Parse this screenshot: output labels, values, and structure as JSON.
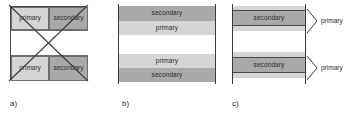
{
  "figure": {
    "title": "",
    "colors": {
      "primary_fill": "#d5d5d5",
      "secondary_fill": "#a9a9a9",
      "gap_fill": "#ffffff",
      "outline": "#4a4a4a",
      "text": "#2b2b2b",
      "background": "#ffffff"
    },
    "labels": {
      "primary": "primary",
      "secondary": "secondary"
    }
  },
  "panels": [
    {
      "id": "a",
      "caption": "a)",
      "crossed_out": true,
      "cells": [
        {
          "label": "primary",
          "kind": "primary",
          "position": "top-left"
        },
        {
          "label": "secondary",
          "kind": "secondary",
          "position": "top-right"
        },
        {
          "label": "",
          "kind": "gap",
          "position": "middle"
        },
        {
          "label": "primary",
          "kind": "primary",
          "position": "bottom-left"
        },
        {
          "label": "secondary",
          "kind": "secondary",
          "position": "bottom-right"
        }
      ]
    },
    {
      "id": "b",
      "caption": "b)",
      "crossed_out": false,
      "bands": [
        {
          "label": "secondary",
          "kind": "secondary"
        },
        {
          "label": "primary",
          "kind": "primary"
        },
        {
          "label": "",
          "kind": "gap"
        },
        {
          "label": "primary",
          "kind": "primary"
        },
        {
          "label": "secondary",
          "kind": "secondary"
        }
      ]
    },
    {
      "id": "c",
      "caption": "c)",
      "crossed_out": false,
      "bands": [
        {
          "label": "",
          "kind": "primary"
        },
        {
          "label": "secondary",
          "kind": "secondary"
        },
        {
          "label": "",
          "kind": "primary"
        },
        {
          "label": "",
          "kind": "gap"
        },
        {
          "label": "",
          "kind": "primary"
        },
        {
          "label": "secondary",
          "kind": "secondary"
        },
        {
          "label": "",
          "kind": "primary"
        }
      ],
      "callouts": [
        {
          "label": "primary"
        },
        {
          "label": "primary"
        }
      ]
    }
  ]
}
